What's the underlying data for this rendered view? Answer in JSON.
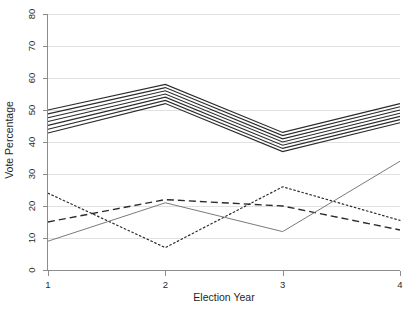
{
  "chart_data": {
    "type": "line",
    "title": "",
    "xlabel": "Election Year",
    "ylabel": "Vote Percentage",
    "x": [
      1,
      2,
      3,
      4
    ],
    "xticklabels": [
      "1",
      "2",
      "3",
      "4"
    ],
    "xlim": [
      1,
      4
    ],
    "ylim": [
      0,
      80
    ],
    "yticks": [
      0,
      10,
      20,
      30,
      40,
      50,
      60,
      70,
      80
    ],
    "yticklabels": [
      "0",
      "10",
      "20",
      "30",
      "40",
      "50",
      "60",
      "70",
      "80"
    ],
    "grid": "horizontal",
    "grid_color": "#d9d9d9",
    "legend": "none",
    "axis_color": "#8c8c8c",
    "series": [
      {
        "name": "band-line-1",
        "style": "solid",
        "color": "#2b2b2b",
        "width": 1.1,
        "values": [
          50.0,
          58.0,
          43.0,
          52.0
        ]
      },
      {
        "name": "band-line-2",
        "style": "solid",
        "color": "#2b2b2b",
        "width": 1.1,
        "values": [
          48.8,
          57.0,
          42.0,
          51.0
        ]
      },
      {
        "name": "band-line-3",
        "style": "solid",
        "color": "#2b2b2b",
        "width": 1.1,
        "values": [
          47.6,
          56.0,
          41.0,
          50.0
        ]
      },
      {
        "name": "band-line-4",
        "style": "solid",
        "color": "#2b2b2b",
        "width": 1.1,
        "values": [
          46.4,
          55.0,
          40.0,
          49.0
        ]
      },
      {
        "name": "band-line-5",
        "style": "solid",
        "color": "#2b2b2b",
        "width": 1.1,
        "values": [
          45.2,
          54.0,
          39.0,
          48.0
        ]
      },
      {
        "name": "band-line-6",
        "style": "solid",
        "color": "#2b2b2b",
        "width": 1.1,
        "values": [
          44.0,
          53.0,
          38.0,
          47.0
        ]
      },
      {
        "name": "band-line-7",
        "style": "solid",
        "color": "#2b2b2b",
        "width": 1.1,
        "values": [
          42.8,
          52.0,
          37.0,
          46.0
        ]
      },
      {
        "name": "dotted-series",
        "style": "dotted",
        "color": "#2b2b2b",
        "width": 1.2,
        "values": [
          24.0,
          7.0,
          26.0,
          15.5
        ]
      },
      {
        "name": "dashed-series",
        "style": "dashed",
        "color": "#2b2b2b",
        "width": 1.4,
        "values": [
          15.0,
          22.0,
          20.0,
          12.5
        ]
      },
      {
        "name": "thin-solid-series",
        "style": "solid",
        "color": "#6b6b6b",
        "width": 0.9,
        "values": [
          9.0,
          21.0,
          12.0,
          34.0
        ]
      }
    ]
  },
  "axes": {
    "y_title": "Vote Percentage",
    "x_title": "Election Year"
  }
}
